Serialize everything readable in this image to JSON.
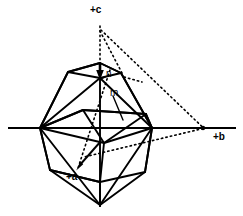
{
  "figure": {
    "background_color": "#ffffff",
    "stroke_color": "#000000",
    "width": 243,
    "height": 216
  },
  "axes": [
    {
      "id": "c-axis",
      "label": "+c",
      "orientation": "vertical",
      "arrow": "down-to-crystal-center",
      "line": {
        "x1": 100,
        "y1": 18,
        "x2": 100,
        "y2": 208
      },
      "solid_from_y": 63,
      "dotted_from_y": 18,
      "arrow_tip": {
        "x": 100,
        "y": 75
      }
    },
    {
      "id": "b-axis",
      "label": "+b",
      "orientation": "horizontal",
      "line": {
        "x1": 8,
        "y1": 128,
        "x2": 236,
        "y2": 128
      },
      "endpoint_dot": {
        "x": 203,
        "y": 128
      }
    },
    {
      "id": "a-axis",
      "label": "+a",
      "orientation": "oblique-toward-viewer",
      "line": {
        "x1": 110,
        "y1": 72,
        "x2": 77,
        "y2": 170
      },
      "arrow_tip": {
        "x": 77,
        "y": 170
      },
      "style": "dotted-behind-solid-front"
    }
  ],
  "face_labels": [
    {
      "id": "face-n",
      "label": "n",
      "x": 106,
      "y": 69,
      "leader_to": {
        "x": 100,
        "y": 78
      }
    },
    {
      "id": "face-m",
      "label": "m",
      "x": 110,
      "y": 88,
      "leader_to": {
        "x": 120,
        "y": 115
      }
    }
  ],
  "construction_lines": {
    "style": "dotted",
    "description": "Face-pole construction triangle from +c apex to +b intercept and back to crystal",
    "segments": [
      {
        "from": {
          "x": 100,
          "y": 30
        },
        "to": {
          "x": 203,
          "y": 128
        }
      },
      {
        "from": {
          "x": 203,
          "y": 128
        },
        "to": {
          "x": 85,
          "y": 157
        }
      },
      {
        "from": {
          "x": 100,
          "y": 30
        },
        "to": {
          "x": 121,
          "y": 73
        }
      }
    ]
  },
  "crystal": {
    "type": "prismatic-bipyramidal-habit",
    "vertices": {
      "top_apex": {
        "x": 100,
        "y": 63
      },
      "bottom_apex": {
        "x": 100,
        "y": 205
      },
      "left_waist": {
        "x": 40,
        "y": 128
      },
      "right_waist": {
        "x": 152,
        "y": 128
      },
      "top_face_front": {
        "x": 100,
        "y": 78
      },
      "top_face_left": {
        "x": 68,
        "y": 72
      },
      "top_face_right": {
        "x": 121,
        "y": 73
      },
      "upper_belt_left": {
        "x": 47,
        "y": 86
      },
      "upper_belt_right": {
        "x": 140,
        "y": 88
      },
      "lower_belt_left": {
        "x": 50,
        "y": 170
      },
      "lower_belt_right": {
        "x": 145,
        "y": 172
      },
      "inner_front": {
        "x": 103,
        "y": 142
      }
    }
  }
}
